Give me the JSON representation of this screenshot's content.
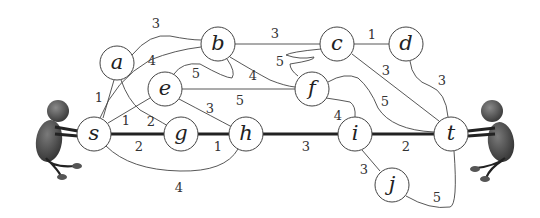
{
  "figure": {
    "colors": {
      "edge": "#444444",
      "node_fill": "#ffffff",
      "figure": "#555555"
    }
  },
  "nodes": [
    {
      "id": "a",
      "label": "a",
      "x": 117,
      "y": 63
    },
    {
      "id": "b",
      "label": "b",
      "x": 218,
      "y": 44
    },
    {
      "id": "c",
      "label": "c",
      "x": 337,
      "y": 44
    },
    {
      "id": "d",
      "label": "d",
      "x": 406,
      "y": 44
    },
    {
      "id": "e",
      "label": "e",
      "x": 165,
      "y": 89
    },
    {
      "id": "f",
      "label": "f",
      "x": 312,
      "y": 89
    },
    {
      "id": "s",
      "label": "s",
      "x": 94,
      "y": 134
    },
    {
      "id": "g",
      "label": "g",
      "x": 181,
      "y": 134
    },
    {
      "id": "h",
      "label": "h",
      "x": 246,
      "y": 134
    },
    {
      "id": "i",
      "label": "i",
      "x": 355,
      "y": 134
    },
    {
      "id": "t",
      "label": "t",
      "x": 451,
      "y": 134
    },
    {
      "id": "j",
      "label": "j",
      "x": 392,
      "y": 185
    }
  ],
  "edges": [
    {
      "from": "a",
      "to": "b",
      "weight": "3"
    },
    {
      "from": "a",
      "to": "s",
      "weight": "1"
    },
    {
      "from": "a",
      "to": "g",
      "weight": "2"
    },
    {
      "from": "s",
      "to": "b",
      "weight": "4"
    },
    {
      "from": "s",
      "to": "e",
      "weight": "1"
    },
    {
      "from": "b",
      "to": "c",
      "weight": "3"
    },
    {
      "from": "b",
      "to": "e",
      "weight": "5"
    },
    {
      "from": "b",
      "to": "f",
      "weight": "4"
    },
    {
      "from": "c",
      "to": "f",
      "weight": "5"
    },
    {
      "from": "c",
      "to": "d",
      "weight": "1"
    },
    {
      "from": "c",
      "to": "t",
      "weight": "3"
    },
    {
      "from": "d",
      "to": "t",
      "weight": "3"
    },
    {
      "from": "e",
      "to": "f",
      "weight": "5"
    },
    {
      "from": "e",
      "to": "h",
      "weight": "3"
    },
    {
      "from": "f",
      "to": "t",
      "weight": "5"
    },
    {
      "from": "f",
      "to": "i",
      "weight": "4"
    },
    {
      "from": "s",
      "to": "g",
      "weight": "2",
      "bold": true
    },
    {
      "from": "g",
      "to": "h",
      "weight": "1",
      "bold": true
    },
    {
      "from": "s",
      "to": "h",
      "weight": "4"
    },
    {
      "from": "h",
      "to": "i",
      "weight": "3",
      "bold": true
    },
    {
      "from": "i",
      "to": "t",
      "weight": "2",
      "bold": true
    },
    {
      "from": "i",
      "to": "j",
      "weight": "3"
    },
    {
      "from": "j",
      "to": "t",
      "weight": "5"
    }
  ],
  "weights": {
    "ab": "3",
    "as": "1",
    "ag": "2",
    "sb": "4",
    "se": "1",
    "bc": "3",
    "be": "5",
    "bf": "4",
    "cf": "5",
    "cd": "1",
    "ct": "3",
    "dt": "3",
    "ef": "5",
    "eh": "3",
    "ft": "5",
    "fi": "4",
    "sg": "2",
    "gh": "1",
    "sh": "4",
    "hi": "3",
    "it": "2",
    "ij": "3",
    "jt": "5"
  },
  "labels": {
    "a": "a",
    "b": "b",
    "c": "c",
    "d": "d",
    "e": "e",
    "f": "f",
    "s": "s",
    "g": "g",
    "h": "h",
    "i": "i",
    "t": "t",
    "j": "j"
  }
}
